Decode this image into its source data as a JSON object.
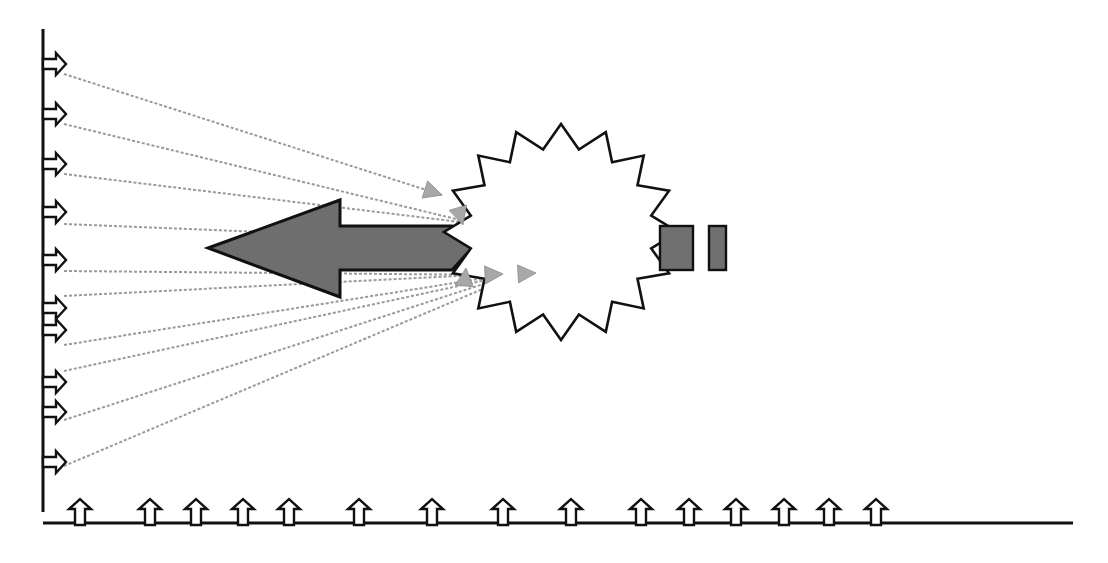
{
  "diagram": {
    "colors": {
      "line": "#111111",
      "ray": "#9a9a9a",
      "big_arrow_fill": "#6e6e6e",
      "block_fill": "#707070",
      "background": "#ffffff"
    },
    "vertical_axis": {
      "x": 43,
      "y1": 29,
      "y2": 512
    },
    "horizontal_axis": {
      "y": 523,
      "x1": 43,
      "x2": 1073
    },
    "left_arrows_y": [
      64,
      114,
      164,
      212,
      260,
      308,
      330,
      382,
      412,
      462
    ],
    "bottom_arrows_x": [
      80,
      150,
      196,
      243,
      289,
      359,
      432,
      503,
      571,
      641,
      689,
      736,
      784,
      829,
      876
    ],
    "rays": [
      {
        "from": [
          64,
          74
        ],
        "to": [
          442,
          195
        ]
      },
      {
        "from": [
          64,
          124
        ],
        "to": [
          460,
          220
        ]
      },
      {
        "from": [
          64,
          174
        ],
        "to": [
          460,
          222
        ]
      },
      {
        "from": [
          64,
          224
        ],
        "to": [
          462,
          240
        ]
      },
      {
        "from": [
          64,
          271
        ],
        "to": [
          498,
          275
        ]
      },
      {
        "from": [
          64,
          296
        ],
        "to": [
          535,
          272
        ]
      },
      {
        "from": [
          64,
          345
        ],
        "to": [
          498,
          276
        ]
      },
      {
        "from": [
          64,
          371
        ],
        "to": [
          500,
          277
        ]
      },
      {
        "from": [
          64,
          420
        ],
        "to": [
          502,
          278
        ]
      },
      {
        "from": [
          64,
          466
        ],
        "to": [
          504,
          280
        ]
      }
    ],
    "ray_heads": [
      {
        "tip": [
          442,
          195
        ],
        "dir": [
          1,
          0.32
        ]
      },
      {
        "tip": [
          463,
          225
        ],
        "dir": [
          0.3,
          1
        ]
      },
      {
        "tip": [
          466,
          268
        ],
        "dir": [
          0.1,
          -1
        ]
      },
      {
        "tip": [
          503,
          274
        ],
        "dir": [
          1,
          -0.05
        ]
      },
      {
        "tip": [
          536,
          273
        ],
        "dir": [
          1,
          -0.05
        ]
      }
    ],
    "big_arrow": {
      "tip": [
        208,
        248
      ],
      "head_top": [
        340,
        200
      ],
      "head_bottom": [
        340,
        297
      ],
      "shaft_top": 226,
      "shaft_bottom": 270,
      "shaft_end": 472
    },
    "starburst": {
      "cx": 561,
      "cy": 232,
      "outer_rx": 117,
      "outer_ry": 108,
      "inner_rx": 92,
      "inner_ry": 84,
      "points": 16
    },
    "blocks": [
      {
        "x": 660,
        "y": 226,
        "w": 33,
        "h": 44
      },
      {
        "x": 709,
        "y": 226,
        "w": 17,
        "h": 44
      }
    ]
  }
}
